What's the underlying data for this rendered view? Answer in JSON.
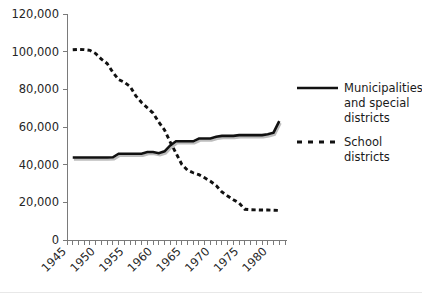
{
  "chart_data": {
    "type": "line",
    "title": "",
    "xlabel": "",
    "ylabel": "",
    "xlim": [
      1945,
      1983
    ],
    "ylim": [
      0,
      120000
    ],
    "grid": false,
    "legend_position": "right",
    "x_ticks": [
      "1945",
      "1950",
      "1955",
      "1960",
      "1965",
      "1970",
      "1975",
      "1980"
    ],
    "x_tick_values": [
      1945,
      1950,
      1955,
      1960,
      1965,
      1970,
      1975,
      1980
    ],
    "y_ticks": [
      "0",
      "20,000",
      "40,000",
      "60,000",
      "80,000",
      "100,000",
      "120,000"
    ],
    "y_tick_values": [
      0,
      20000,
      40000,
      60000,
      80000,
      100000,
      120000
    ],
    "x_minor_tick_interval": 1,
    "series": [
      {
        "name": "Municipalities and special districts",
        "style": "solid",
        "color": "#111111",
        "x": [
          1946,
          1947,
          1948,
          1949,
          1950,
          1951,
          1952,
          1953,
          1954,
          1955,
          1956,
          1957,
          1958,
          1959,
          1960,
          1961,
          1962,
          1963,
          1964,
          1965,
          1966,
          1967,
          1968,
          1969,
          1970,
          1971,
          1972,
          1973,
          1974,
          1975,
          1976,
          1977,
          1978,
          1979,
          1980,
          1981,
          1982
        ],
        "values": [
          43800,
          43800,
          43800,
          43800,
          43800,
          43800,
          43800,
          43900,
          45800,
          45800,
          45800,
          45800,
          45800,
          46700,
          46700,
          46100,
          47100,
          50200,
          52400,
          52400,
          52400,
          52400,
          53900,
          53900,
          53900,
          54800,
          55300,
          55300,
          55300,
          55700,
          55700,
          55700,
          55700,
          55700,
          56200,
          57000,
          63100
        ]
      },
      {
        "name": "School districts",
        "style": "dashed",
        "color": "#111111",
        "x": [
          1946,
          1947,
          1948,
          1949,
          1950,
          1951,
          1952,
          1953,
          1954,
          1955,
          1956,
          1957,
          1958,
          1959,
          1960,
          1961,
          1962,
          1963,
          1964,
          1965,
          1966,
          1967,
          1968,
          1969,
          1970,
          1971,
          1972,
          1973,
          1974,
          1975,
          1976,
          1977,
          1978,
          1979,
          1980,
          1981,
          1982
        ],
        "values": [
          101000,
          101200,
          101100,
          100700,
          99000,
          96000,
          93700,
          89000,
          85200,
          83700,
          81500,
          76500,
          73000,
          70200,
          67400,
          62600,
          58400,
          52000,
          46100,
          40200,
          37100,
          35700,
          34700,
          33000,
          31200,
          28900,
          25500,
          23400,
          21400,
          19600,
          16300,
          16100,
          16000,
          15900,
          15900,
          15800,
          15700
        ]
      }
    ],
    "legend": [
      {
        "label_lines": [
          "Municipalities",
          "and special",
          "districts"
        ],
        "style": "solid"
      },
      {
        "label_lines": [
          "School",
          "districts"
        ],
        "style": "dashed"
      }
    ]
  }
}
